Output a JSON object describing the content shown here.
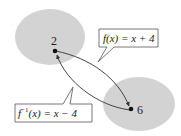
{
  "diagram": {
    "type": "function-mapping",
    "domain_set": {
      "element": "2",
      "fill": "#d3d3d3"
    },
    "range_set": {
      "element": "6",
      "fill": "#d3d3d3"
    },
    "forward_label": {
      "prefix": "f(x) = x + 4"
    },
    "inverse_label": {
      "f": "f",
      "superscript": "−1",
      "rest": "(x) = x − 4"
    },
    "colors": {
      "set_fill": "#d3d3d3",
      "arrow": "#333333",
      "label_border": "#555555",
      "text": "#222222"
    }
  }
}
